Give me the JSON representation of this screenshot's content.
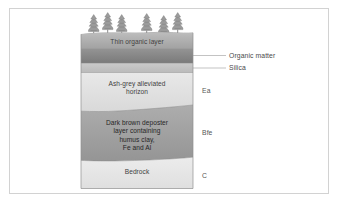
{
  "figure": {
    "kind": "soil-profile-diagram",
    "border_color": "#d2d2d2",
    "background_color": "#ffffff"
  },
  "vegetation": {
    "icon": "conifer-tree-icon",
    "count": 6,
    "groups": [
      3,
      3
    ],
    "color": "#8f8f8f"
  },
  "layers": [
    {
      "id": "thin-organic-layer",
      "label": "Thin organic layer",
      "horizon_code": "",
      "fill_top": "#b5b5b5",
      "fill_bottom": "#a5a5a5"
    },
    {
      "id": "organic-matter-band",
      "label": "",
      "horizon_code": "",
      "fill_top": "#8c8c8c",
      "fill_bottom": "#7e7e7e"
    },
    {
      "id": "silica-band",
      "label": "",
      "horizon_code": "",
      "fill_top": "#c6c6c6",
      "fill_bottom": "#bdbdbd"
    },
    {
      "id": "ash-grey-horizon",
      "label": "Ash-grey alleviated\nhorizon",
      "horizon_code": "Ea",
      "fill_top": "#e4e4e4",
      "fill_bottom": "#dcdcdc"
    },
    {
      "id": "dark-brown-deposit",
      "label": "Dark brown deposter\nlayer containing\nhumus clay,\nFe and Al",
      "horizon_code": "Bfe",
      "fill_top": "#a8a8a8",
      "fill_bottom": "#999999"
    },
    {
      "id": "bedrock",
      "label": "Bedrock",
      "horizon_code": "C",
      "fill_top": "#e9e9e9",
      "fill_bottom": "#e2e2e2"
    }
  ],
  "callouts": [
    {
      "id": "organic-matter",
      "label": "Organic matter"
    },
    {
      "id": "silica",
      "label": "Silica"
    }
  ],
  "leader_line_color": "#9a9a9a"
}
